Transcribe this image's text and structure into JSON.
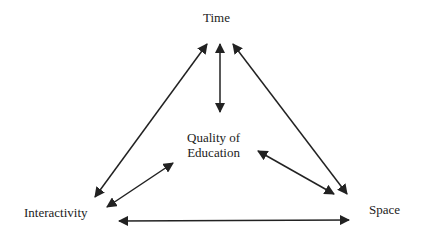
{
  "diagram": {
    "nodes": {
      "time": {
        "label": "Time"
      },
      "quality": {
        "label_line1": "Quality of",
        "label_line2": "Education"
      },
      "interactivity": {
        "label": "Interactivity"
      },
      "space": {
        "label": "Space"
      }
    },
    "edges": [
      {
        "from": "time",
        "to": "interactivity",
        "type": "bidirectional"
      },
      {
        "from": "time",
        "to": "quality",
        "type": "bidirectional"
      },
      {
        "from": "time",
        "to": "space",
        "type": "bidirectional"
      },
      {
        "from": "quality",
        "to": "interactivity",
        "type": "bidirectional"
      },
      {
        "from": "quality",
        "to": "space",
        "type": "bidirectional"
      },
      {
        "from": "interactivity",
        "to": "space",
        "type": "bidirectional"
      }
    ],
    "colors": {
      "line": "#222222",
      "text": "#222222",
      "background": "#ffffff"
    }
  }
}
